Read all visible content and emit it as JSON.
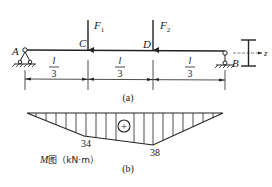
{
  "figure_a": {
    "caption": "(a)",
    "support_left_label": "A",
    "support_right_label": "B",
    "point_c_label": "C",
    "point_d_label": "D",
    "force1": {
      "label": "F",
      "sub": "1"
    },
    "force2": {
      "label": "F",
      "sub": "2"
    },
    "segments": [
      {
        "num": "l",
        "den": "3"
      },
      {
        "num": "l",
        "den": "3"
      },
      {
        "num": "l",
        "den": "3"
      }
    ],
    "section_axis_label": "z"
  },
  "figure_b": {
    "caption": "(b)",
    "sign": "+",
    "value_c": "34",
    "value_d": "38",
    "diagram_title_m": "M",
    "diagram_title_rest": "图（kN·m）"
  },
  "colors": {
    "ink": "#222222",
    "background": "#ffffff"
  }
}
